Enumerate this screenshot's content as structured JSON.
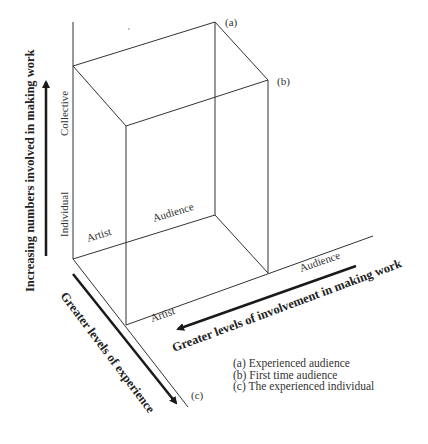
{
  "diagram": {
    "vertical_axis": {
      "title": "Increasing numbers involved in making work",
      "ticks": [
        "Individual",
        "Collective"
      ]
    },
    "horizontal_axis": {
      "title": "Greater levels of involvement in making work",
      "ticks": [
        "Artist",
        "Audience"
      ]
    },
    "depth_axis": {
      "title": "Greater levels of experience"
    },
    "back_face_labels": [
      "Artist",
      "Audience"
    ],
    "corner_labels": {
      "a": "(a)",
      "b": "(b)",
      "c": "(c)"
    },
    "legend": [
      "(a) Experienced audience",
      "(b) First time audience",
      "(c) The experienced individual"
    ],
    "colors": {
      "line": "#333333",
      "arrow": "#1a1a1a",
      "text": "#333333"
    }
  }
}
